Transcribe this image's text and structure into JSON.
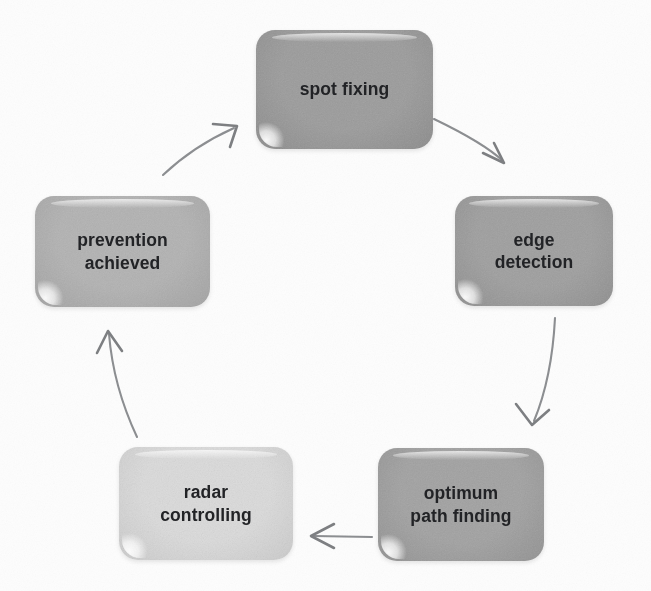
{
  "diagram": {
    "type": "cyclic-process-flowchart",
    "title": "",
    "direction": "clockwise",
    "node_count": 5,
    "arrow_count": 5,
    "colors": {
      "background": "#fdfdfd",
      "node_fill_dark": "#9a9a9a",
      "node_fill_medium": "#a8a8a8",
      "node_fill_light": "#dcdcdc",
      "node_text": "#222326",
      "arrow_stroke": "#8d8f92"
    },
    "nodes": [
      {
        "id": "spot-fixing",
        "label": "spot fixing",
        "fill": "#9d9d9d",
        "fill_edge": "#8d8d8d",
        "x": 256,
        "y": 30,
        "width": 177,
        "height": 119,
        "order": 1
      },
      {
        "id": "edge-detection",
        "label": "edge\ndetection",
        "fill": "#a0a0a0",
        "fill_edge": "#909090",
        "x": 455,
        "y": 196,
        "width": 158,
        "height": 110,
        "order": 2
      },
      {
        "id": "optimum-path-finding",
        "label": "optimum\npath finding",
        "fill": "#a3a3a3",
        "fill_edge": "#939393",
        "x": 378,
        "y": 448,
        "width": 166,
        "height": 113,
        "order": 3
      },
      {
        "id": "radar-controlling",
        "label": "radar\ncontrolling",
        "fill": "#dcdcdc",
        "fill_edge": "#cccccc",
        "x": 119,
        "y": 447,
        "width": 174,
        "height": 113,
        "order": 4
      },
      {
        "id": "prevention-achieved",
        "label": "prevention\nachieved",
        "fill": "#b4b4b4",
        "fill_edge": "#a4a4a4",
        "x": 35,
        "y": 196,
        "width": 175,
        "height": 111,
        "order": 5
      }
    ],
    "arrows": [
      {
        "id": "arrow-spot-fixing-to-edge-detection",
        "from": "spot-fixing",
        "to": "edge-detection",
        "shape": "curve",
        "path": "M 434 119 C 461 132 487 146 503 161",
        "head": "M 483 153 L 504 163 L 494 143",
        "style": "open-v-head"
      },
      {
        "id": "arrow-edge-detection-to-optimum-path-finding",
        "from": "edge-detection",
        "to": "optimum-path-finding",
        "shape": "curve",
        "path": "M 555 318 C 553 357 546 392 534 421",
        "head": "M 516 404 L 532 425 L 549 410",
        "style": "open-v-head"
      },
      {
        "id": "arrow-optimum-path-finding-to-radar-controlling",
        "from": "optimum-path-finding",
        "to": "radar-controlling",
        "shape": "straight",
        "path": "M 372 537 L 314 536",
        "head": "M 334 524 L 311 536 L 334 548",
        "style": "open-v-head"
      },
      {
        "id": "arrow-radar-controlling-to-prevention-achieved",
        "from": "radar-controlling",
        "to": "prevention-achieved",
        "shape": "curve",
        "path": "M 137 437 C 122 405 112 371 109 334",
        "head": "M 97 353 L 108 331 L 122 351",
        "style": "open-v-head"
      },
      {
        "id": "arrow-prevention-achieved-to-spot-fixing",
        "from": "prevention-achieved",
        "to": "spot-fixing",
        "shape": "curve",
        "path": "M 163 175 C 182 157 205 141 234 128",
        "head": "M 213 124 L 237 126 L 230 147",
        "style": "open-v-head"
      }
    ]
  }
}
